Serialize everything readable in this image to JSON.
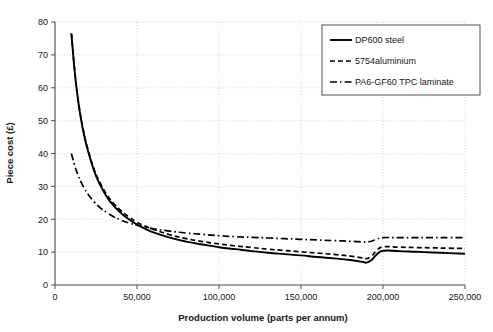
{
  "chart_data": {
    "type": "line",
    "title": "",
    "xlabel": "Production volume (parts per annum)",
    "ylabel": "Piece cost (£)",
    "xlim": [
      0,
      250000
    ],
    "ylim": [
      0,
      80
    ],
    "xticks": [
      0,
      50000,
      100000,
      150000,
      200000,
      250000
    ],
    "xtick_labels": [
      "0",
      "50,000",
      "100,000",
      "150,000",
      "200,000",
      "250,000"
    ],
    "yticks": [
      0,
      10,
      20,
      30,
      40,
      50,
      60,
      70,
      80
    ],
    "ytick_labels": [
      "0",
      "10",
      "20",
      "30",
      "40",
      "50",
      "60",
      "70",
      "80"
    ],
    "grid": true,
    "legend_position": "top-right",
    "series": [
      {
        "name": "DP600 steel",
        "style": "solid",
        "color": "#000000",
        "x": [
          10000,
          12000,
          14000,
          16000,
          18000,
          20000,
          24000,
          28000,
          32000,
          36000,
          40000,
          45000,
          50000,
          55000,
          60000,
          70000,
          80000,
          90000,
          100000,
          110000,
          120000,
          130000,
          140000,
          150000,
          160000,
          170000,
          180000,
          188000,
          190000,
          193000,
          196000,
          200000,
          210000,
          220000,
          230000,
          240000,
          250000
        ],
        "y": [
          76.5,
          65.0,
          56.5,
          50.0,
          45.0,
          41.0,
          34.5,
          30.0,
          26.5,
          24.0,
          22.0,
          20.0,
          18.4,
          17.1,
          16.0,
          14.4,
          13.2,
          12.3,
          11.5,
          10.9,
          10.3,
          9.8,
          9.4,
          9.0,
          8.5,
          8.1,
          7.6,
          7.0,
          6.8,
          7.6,
          9.2,
          10.4,
          10.3,
          10.1,
          9.9,
          9.7,
          9.5
        ]
      },
      {
        "name": "5754aluminium",
        "style": "dashed",
        "color": "#000000",
        "x": [
          10000,
          12000,
          14000,
          16000,
          18000,
          20000,
          24000,
          28000,
          32000,
          36000,
          40000,
          45000,
          50000,
          55000,
          60000,
          70000,
          80000,
          90000,
          100000,
          110000,
          120000,
          130000,
          140000,
          150000,
          160000,
          170000,
          180000,
          188000,
          190000,
          193000,
          196000,
          200000,
          210000,
          220000,
          230000,
          240000,
          250000
        ],
        "y": [
          76.5,
          65.2,
          56.8,
          50.4,
          45.4,
          41.4,
          35.0,
          30.6,
          27.2,
          24.7,
          22.7,
          20.7,
          19.1,
          17.9,
          16.9,
          15.3,
          14.1,
          13.2,
          12.5,
          11.9,
          11.4,
          10.9,
          10.5,
          10.1,
          9.7,
          9.3,
          8.8,
          8.2,
          8.0,
          8.8,
          10.4,
          11.6,
          11.5,
          11.4,
          11.3,
          11.2,
          11.1
        ]
      },
      {
        "name": "PA6-GF60 TPC laminate",
        "style": "dashdot",
        "color": "#000000",
        "x": [
          10000,
          12000,
          14000,
          16000,
          18000,
          20000,
          24000,
          28000,
          32000,
          36000,
          40000,
          45000,
          50000,
          55000,
          60000,
          70000,
          80000,
          90000,
          100000,
          110000,
          120000,
          130000,
          140000,
          150000,
          160000,
          170000,
          180000,
          188000,
          190000,
          193000,
          196000,
          200000,
          210000,
          220000,
          230000,
          240000,
          250000
        ],
        "y": [
          40.0,
          36.4,
          33.5,
          31.2,
          29.3,
          27.7,
          25.2,
          23.3,
          21.9,
          20.7,
          19.8,
          18.9,
          18.2,
          17.6,
          17.1,
          16.4,
          15.8,
          15.4,
          15.0,
          14.7,
          14.5,
          14.3,
          14.1,
          13.9,
          13.7,
          13.5,
          13.3,
          13.1,
          13.1,
          13.3,
          13.9,
          14.4,
          14.4,
          14.4,
          14.4,
          14.4,
          14.4
        ]
      }
    ]
  },
  "legend": {
    "items": [
      {
        "label": "DP600 steel",
        "style": "solid"
      },
      {
        "label": "5754aluminium",
        "style": "dashed"
      },
      {
        "label": "PA6-GF60 TPC laminate",
        "style": "dashdot"
      }
    ]
  },
  "colors": {
    "series": "#000000",
    "grid": "#c9c9c9",
    "frame": "#4a4a4a",
    "background": "#ffffff"
  }
}
